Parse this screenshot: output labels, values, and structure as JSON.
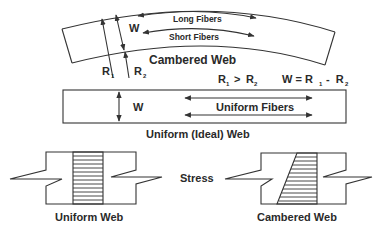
{
  "diagram": {
    "cambered_web": {
      "title": "Cambered Web",
      "long_fibers_label": "Long Fibers",
      "short_fibers_label": "Short Fibers",
      "width_label": "W",
      "r1_label": "R",
      "r1_sub": "1",
      "r2_label": "R",
      "r2_sub": "2"
    },
    "relations": {
      "inequality_r1": "R",
      "inequality_r1_sub": "1",
      "inequality_op": " > ",
      "inequality_r2": "R",
      "inequality_r2_sub": "2",
      "width_eq_lhs": "W = R",
      "width_eq_r1_sub": "1",
      "width_eq_minus": " -  R",
      "width_eq_r2_sub": "2"
    },
    "uniform_web": {
      "title": "Uniform (Ideal) Web",
      "width_label": "W",
      "fibers_label": "Uniform Fibers"
    },
    "stress_section": {
      "stress_label": "Stress",
      "left_caption": "Uniform Web",
      "right_caption": "Cambered Web"
    },
    "colors": {
      "line": "#333333",
      "text": "#2a2a2a",
      "background": "#ffffff"
    }
  }
}
